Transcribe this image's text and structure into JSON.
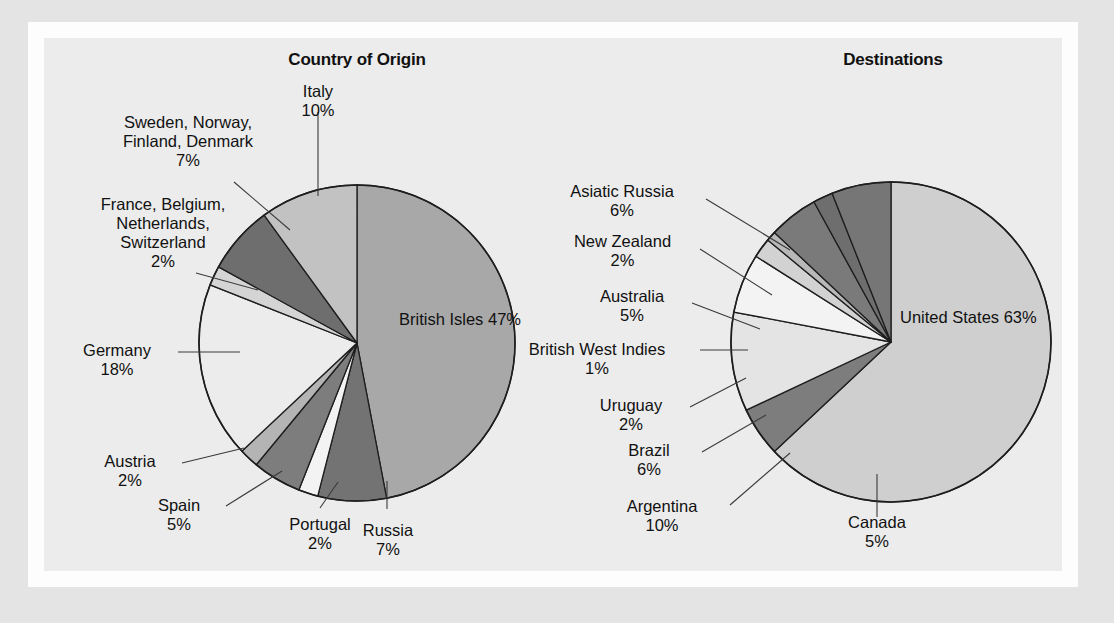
{
  "figure": {
    "background_color": "#e4e4e4",
    "mat_color": "#fdfdfd",
    "panel_color": "#ececec"
  },
  "chart_data": [
    {
      "type": "pie",
      "title": "Country of Origin",
      "xlabel": "",
      "ylabel": "",
      "legend_position": "none",
      "grid": false,
      "start_angle_deg": 0,
      "direction": "clockwise",
      "categories": [
        "British Isles",
        "Russia",
        "Portugal",
        "Spain",
        "Austria",
        "Germany",
        "France, Belgium, Netherlands, Switzerland",
        "Sweden, Norway, Finland, Denmark",
        "Italy"
      ],
      "values": [
        47,
        7,
        2,
        5,
        2,
        18,
        2,
        7,
        10
      ],
      "value_labels": [
        "47%",
        "7%",
        "2%",
        "5%",
        "2%",
        "18%",
        "2%",
        "7%",
        "10%"
      ],
      "colors": [
        "#a8a8a8",
        "#737373",
        "#f3f3f3",
        "#7d7d7d",
        "#b4b4b4",
        "#ececec",
        "#d4d4d4",
        "#6e6e6e",
        "#c2c2c2"
      ],
      "slices": [
        {
          "name": "British Isles",
          "label_lines": [
            "British Isles"
          ],
          "pct": "47%",
          "color": "#a8a8a8"
        },
        {
          "name": "Russia",
          "label_lines": [
            "Russia"
          ],
          "pct": "7%",
          "color": "#737373"
        },
        {
          "name": "Portugal",
          "label_lines": [
            "Portugal"
          ],
          "pct": "2%",
          "color": "#f3f3f3"
        },
        {
          "name": "Spain",
          "label_lines": [
            "Spain"
          ],
          "pct": "5%",
          "color": "#7d7d7d"
        },
        {
          "name": "Austria",
          "label_lines": [
            "Austria"
          ],
          "pct": "2%",
          "color": "#b4b4b4"
        },
        {
          "name": "Germany",
          "label_lines": [
            "Germany"
          ],
          "pct": "18%",
          "color": "#ececec"
        },
        {
          "name": "France, Belgium, Netherlands, Switzerland",
          "label_lines": [
            "France, Belgium,",
            "Netherlands,",
            "Switzerland"
          ],
          "pct": "2%",
          "color": "#d4d4d4"
        },
        {
          "name": "Sweden, Norway, Finland, Denmark",
          "label_lines": [
            "Sweden, Norway,",
            "Finland, Denmark"
          ],
          "pct": "7%",
          "color": "#6e6e6e"
        },
        {
          "name": "Italy",
          "label_lines": [
            "Italy"
          ],
          "pct": "10%",
          "color": "#c2c2c2"
        }
      ]
    },
    {
      "type": "pie",
      "title": "Destinations",
      "xlabel": "",
      "ylabel": "",
      "legend_position": "none",
      "grid": false,
      "start_angle_deg": 0,
      "direction": "clockwise",
      "categories": [
        "United States",
        "Canada",
        "Argentina",
        "Brazil",
        "Uruguay",
        "British West Indies",
        "Australia",
        "New Zealand",
        "Asiatic Russia"
      ],
      "values": [
        63,
        5,
        10,
        6,
        2,
        1,
        5,
        2,
        6
      ],
      "value_labels": [
        "63%",
        "5%",
        "10%",
        "6%",
        "2%",
        "1%",
        "5%",
        "2%",
        "6%"
      ],
      "colors": [
        "#cfcfcf",
        "#7d7d7d",
        "#e4e4e4",
        "#f3f3f3",
        "#d2d2d2",
        "#b8b8b8",
        "#7a7a7a",
        "#6e6e6e",
        "#767676"
      ],
      "slices": [
        {
          "name": "United States",
          "label_lines": [
            "United States"
          ],
          "pct": "63%",
          "color": "#cfcfcf"
        },
        {
          "name": "Canada",
          "label_lines": [
            "Canada"
          ],
          "pct": "5%",
          "color": "#7d7d7d"
        },
        {
          "name": "Argentina",
          "label_lines": [
            "Argentina"
          ],
          "pct": "10%",
          "color": "#e4e4e4"
        },
        {
          "name": "Brazil",
          "label_lines": [
            "Brazil"
          ],
          "pct": "6%",
          "color": "#f3f3f3"
        },
        {
          "name": "Uruguay",
          "label_lines": [
            "Uruguay"
          ],
          "pct": "2%",
          "color": "#d2d2d2"
        },
        {
          "name": "British West Indies",
          "label_lines": [
            "British West Indies"
          ],
          "pct": "1%",
          "color": "#b8b8b8"
        },
        {
          "name": "Australia",
          "label_lines": [
            "Australia"
          ],
          "pct": "5%",
          "color": "#7a7a7a"
        },
        {
          "name": "New Zealand",
          "label_lines": [
            "New Zealand"
          ],
          "pct": "2%",
          "color": "#6e6e6e"
        },
        {
          "name": "Asiatic Russia",
          "label_lines": [
            "Asiatic Russia"
          ],
          "pct": "6%",
          "color": "#767676"
        }
      ]
    }
  ],
  "labels": {
    "origin": {
      "italy": {
        "l1": "Italy",
        "pct": "10%"
      },
      "nordic": {
        "l1": "Sweden, Norway,",
        "l2": "Finland, Denmark",
        "pct": "7%"
      },
      "lowlands": {
        "l1": "France, Belgium,",
        "l2": "Netherlands,",
        "l3": "Switzerland",
        "pct": "2%"
      },
      "germany": {
        "l1": "Germany",
        "pct": "18%"
      },
      "austria": {
        "l1": "Austria",
        "pct": "2%"
      },
      "spain": {
        "l1": "Spain",
        "pct": "5%"
      },
      "portugal": {
        "l1": "Portugal",
        "pct": "2%"
      },
      "russia": {
        "l1": "Russia",
        "pct": "7%"
      },
      "british": {
        "l1": "British Isles",
        "pct": "47%"
      }
    },
    "destinations": {
      "asiatic": {
        "l1": "Asiatic Russia",
        "pct": "6%"
      },
      "newzeal": {
        "l1": "New Zealand",
        "pct": "2%"
      },
      "australia": {
        "l1": "Australia",
        "pct": "5%"
      },
      "bwi": {
        "l1": "British West Indies",
        "pct": "1%"
      },
      "uruguay": {
        "l1": "Uruguay",
        "pct": "2%"
      },
      "brazil": {
        "l1": "Brazil",
        "pct": "6%"
      },
      "argentina": {
        "l1": "Argentina",
        "pct": "10%"
      },
      "canada": {
        "l1": "Canada",
        "pct": "5%"
      },
      "usa": {
        "l1": "United States",
        "pct": "63%"
      }
    }
  }
}
